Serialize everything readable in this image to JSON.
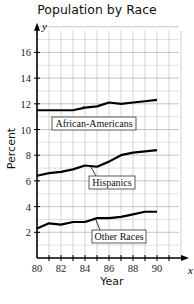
{
  "chart_data": {
    "type": "line",
    "title": "Population by Race",
    "xlabel": "Year",
    "ylabel": "Percent",
    "x_axis_var": "x",
    "y_axis_var": "y",
    "x": [
      80,
      81,
      82,
      83,
      84,
      85,
      86,
      87,
      88,
      89,
      90
    ],
    "x_ticks": [
      80,
      82,
      84,
      86,
      88,
      90
    ],
    "y_ticks": [
      2,
      4,
      6,
      8,
      10,
      12,
      14,
      16
    ],
    "xlim": [
      80,
      92
    ],
    "ylim": [
      0,
      18
    ],
    "grid": true,
    "legend": "inline labels",
    "series": [
      {
        "name": "African-Americans",
        "values": [
          11.5,
          11.5,
          11.5,
          11.5,
          11.7,
          11.8,
          12.1,
          12.0,
          12.1,
          12.2,
          12.3
        ]
      },
      {
        "name": "Hispanics",
        "values": [
          6.4,
          6.6,
          6.7,
          6.9,
          7.2,
          7.1,
          7.5,
          8.0,
          8.2,
          8.3,
          8.4
        ]
      },
      {
        "name": "Other Races",
        "values": [
          2.3,
          2.7,
          2.6,
          2.8,
          2.8,
          3.1,
          3.1,
          3.2,
          3.4,
          3.6,
          3.6
        ]
      }
    ]
  }
}
